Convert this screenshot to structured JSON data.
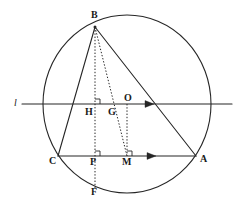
{
  "figure": {
    "kind": "euclidean-geometry-diagram",
    "stroke_color": "#262626",
    "background_color": "#ffffff",
    "width": 238,
    "height": 211
  },
  "circle": {
    "name": "circumcircle",
    "center": {
      "x": 127,
      "y": 104
    },
    "radius_x": 84,
    "radius_y": 89
  },
  "points": [
    {
      "id": "B",
      "label": "B",
      "x": 95,
      "y": 27,
      "label_x": 91,
      "label_y": 10
    },
    {
      "id": "O",
      "label": "O",
      "x": 127,
      "y": 104,
      "label_x": 124,
      "label_y": 93
    },
    {
      "id": "H",
      "label": "H",
      "x": 95,
      "y": 104,
      "label_x": 85,
      "label_y": 107
    },
    {
      "id": "G",
      "label": "G",
      "x": 112,
      "y": 104,
      "label_x": 108,
      "label_y": 107
    },
    {
      "id": "C",
      "label": "C",
      "x": 58,
      "y": 156,
      "label_x": 49,
      "label_y": 156
    },
    {
      "id": "P",
      "label": "P",
      "x": 95,
      "y": 156,
      "label_x": 90,
      "label_y": 157
    },
    {
      "id": "M",
      "label": "M",
      "x": 127,
      "y": 156,
      "label_x": 122,
      "label_y": 157
    },
    {
      "id": "A",
      "label": "A",
      "x": 196,
      "y": 156,
      "label_x": 200,
      "label_y": 154
    },
    {
      "id": "F",
      "label": "F",
      "x": 95,
      "y": 190,
      "label_x": 91,
      "label_y": 187
    }
  ],
  "line_label": {
    "id": "l",
    "label": "l",
    "x": 14,
    "y": 98
  },
  "solid_segments": [
    {
      "name": "side-BC",
      "from": "B",
      "to": "C"
    },
    {
      "name": "side-BA",
      "from": "B",
      "to": "A"
    },
    {
      "name": "side-CA",
      "from": "C",
      "to": "A"
    },
    {
      "name": "line-l",
      "from": {
        "x": 22,
        "y": 104
      },
      "to": {
        "x": 232,
        "y": 104
      }
    }
  ],
  "dotted_segments": [
    {
      "name": "altitude-BF",
      "from": "B",
      "to": "F"
    },
    {
      "name": "median-BM",
      "from": "B",
      "to": "M"
    },
    {
      "name": "perp-OM",
      "from": "O",
      "to": "M"
    }
  ],
  "arrows": [
    {
      "name": "arrow-on-line-l",
      "x": 150,
      "y": 104
    },
    {
      "name": "arrow-on-side-CA",
      "x": 152,
      "y": 156
    }
  ],
  "right_angle_marks": [
    {
      "name": "right-angle-at-H",
      "x": 95,
      "y": 104
    },
    {
      "name": "right-angle-at-P",
      "x": 95,
      "y": 156
    },
    {
      "name": "right-angle-at-M",
      "x": 127,
      "y": 156
    }
  ]
}
